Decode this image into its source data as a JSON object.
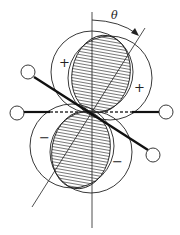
{
  "diagram": {
    "type": "orbital-overlap",
    "labels": {
      "angle": "θ",
      "upper_left_sign": "+",
      "upper_right_sign": "+",
      "lower_left_sign": "−",
      "lower_right_sign": "−"
    },
    "colors": {
      "line": "#222222",
      "hatch": "#444444",
      "background": "#ffffff"
    }
  }
}
